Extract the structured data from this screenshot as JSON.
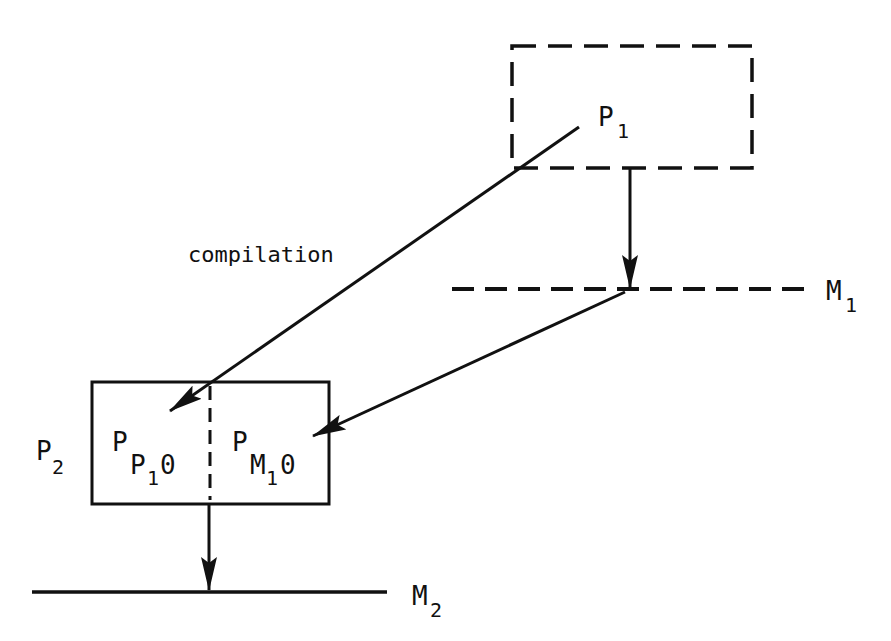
{
  "diagram": {
    "colors": {
      "ink": "#111111",
      "background": "#ffffff"
    },
    "nodes": {
      "p1": {
        "label": "P",
        "subscript": "1",
        "style": "dashed-box"
      },
      "m1": {
        "label": "M",
        "subscript": "1",
        "style": "dashed-line"
      },
      "p2": {
        "label": "P",
        "subscript": "2",
        "style": "solid-box",
        "left_compartment": {
          "label": "P",
          "sub1": "P",
          "sub2": "1",
          "suffix": "0"
        },
        "right_compartment": {
          "label": "P",
          "sub1": "M",
          "sub2": "1",
          "suffix": "0"
        }
      },
      "m2": {
        "label": "M",
        "subscript": "2",
        "style": "solid-line"
      }
    },
    "edges": [
      {
        "from": "p1",
        "to": "m1",
        "type": "arrow"
      },
      {
        "from": "p1",
        "to": "p2.left_compartment",
        "type": "arrow",
        "label": "compilation"
      },
      {
        "from": "m1",
        "to": "p2.right_compartment",
        "type": "arrow"
      },
      {
        "from": "p2",
        "to": "m2",
        "type": "arrow"
      }
    ],
    "edge_label": "compilation"
  }
}
